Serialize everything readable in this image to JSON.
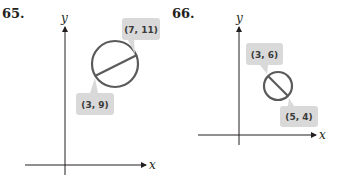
{
  "figures": [
    {
      "number": "65.",
      "x_label": "x",
      "y_label": "y",
      "points": [
        {
          "label": "(7, 11)",
          "x": 7,
          "y": 11
        },
        {
          "label": "(3, 9)",
          "x": 3,
          "y": 9
        }
      ],
      "description": "Circle with diameter endpoints (3, 9) and (7, 11)"
    },
    {
      "number": "66.",
      "x_label": "x",
      "y_label": "y",
      "points": [
        {
          "label": "(3, 6)",
          "x": 3,
          "y": 6
        },
        {
          "label": "(5, 4)",
          "x": 5,
          "y": 4
        }
      ],
      "description": "Circle with diameter endpoints (3, 6) and (5, 4)"
    }
  ],
  "colors": {
    "circle": "#5a5a5a",
    "axis": "#231f20",
    "callout_bg": "#d9d9d9"
  }
}
